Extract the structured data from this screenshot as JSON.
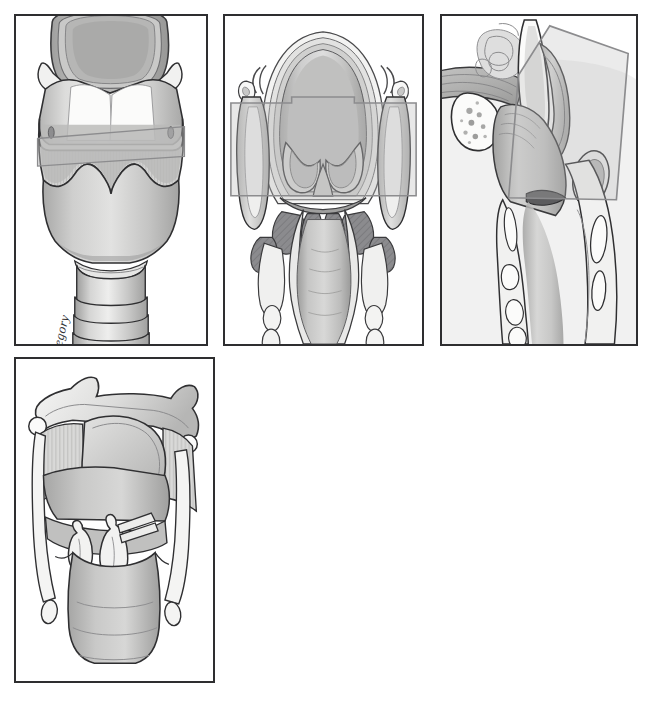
{
  "figure": {
    "background_color": "#ffffff",
    "width": 652,
    "height": 707,
    "artist_signature": "Gregory"
  },
  "palette": {
    "panel_border": "#2e2e30",
    "outline_dark": "#2b2b2d",
    "outline_mid": "#55565a",
    "cartilage_light": "#f1f1f0",
    "cartilage_mid": "#d3d3d2",
    "tissue_mid": "#bdbdbc",
    "tissue_dark": "#9d9d9c",
    "muscle_dark": "#87878a",
    "plane_overlay": "#b9b9b9",
    "plane_overlay_stroke": "#8e8e90",
    "highlight": "#fbfbfa",
    "shadow": "#7c7c7e"
  },
  "panels": [
    {
      "id": "panel-a",
      "label": "A",
      "view": "anterior-view-larynx",
      "description": "Anterior view of the larynx showing epiglottis, hyoid bone, thyroid cartilage, cricoid cartilage and upper tracheal rings",
      "structures": [
        "epiglottis",
        "hyoid-bone",
        "thyrohyoid-membrane",
        "thyroid-cartilage",
        "cricothyroid-membrane",
        "cricoid-cartilage",
        "tracheal-rings"
      ],
      "has_section_plane": true,
      "section_plane_orientation": "coronal",
      "geometry": {
        "x": 14,
        "y": 14,
        "width": 194,
        "height": 332
      }
    },
    {
      "id": "panel-b",
      "label": "B",
      "view": "coronal-section-larynx",
      "description": "Coronal section through the larynx showing ventricular folds, laryngeal ventricle, vocal folds and thyroarytenoid muscles",
      "structures": [
        "epiglottis",
        "aryepiglottic-fold",
        "vestibular-fold",
        "laryngeal-ventricle",
        "vocal-fold",
        "thyroarytenoid-muscle",
        "conus-elasticus",
        "thyroid-lamina",
        "cricoid-cartilage",
        "tracheal-lumen"
      ],
      "has_section_plane": true,
      "section_plane_orientation": "axial-band",
      "geometry": {
        "x": 223,
        "y": 14,
        "width": 201,
        "height": 332
      }
    },
    {
      "id": "panel-c",
      "label": "C",
      "view": "sagittal-section-larynx",
      "description": "Midsagittal section of the larynx and pharynx showing tongue base, hyoid, epiglottis, preepiglottic space and tracheal rings",
      "structures": [
        "tongue-base",
        "hyoid-bone",
        "epiglottis",
        "preepiglottic-space",
        "vestibular-fold",
        "vocal-fold",
        "thyroid-cartilage",
        "cricoid-cartilage",
        "tracheal-rings",
        "esophageal-wall"
      ],
      "has_section_plane": true,
      "section_plane_orientation": "oblique",
      "geometry": {
        "x": 440,
        "y": 14,
        "width": 198,
        "height": 332
      }
    },
    {
      "id": "panel-d",
      "label": "D",
      "view": "posterior-view-larynx",
      "description": "Posterior view of the laryngeal cartilage framework showing epiglottis, arytenoid and corniculate cartilages, cricoid lamina and posterior cricoarytenoid region",
      "structures": [
        "epiglottis",
        "superior-cornu",
        "greater-cornu-hyoid",
        "thyrohyoid-membrane",
        "arytenoid-cartilage",
        "corniculate-cartilage",
        "vocal-process",
        "cricoid-lamina",
        "inferior-cornu",
        "trachea"
      ],
      "has_section_plane": false,
      "geometry": {
        "x": 14,
        "y": 357,
        "width": 201,
        "height": 326
      }
    }
  ]
}
